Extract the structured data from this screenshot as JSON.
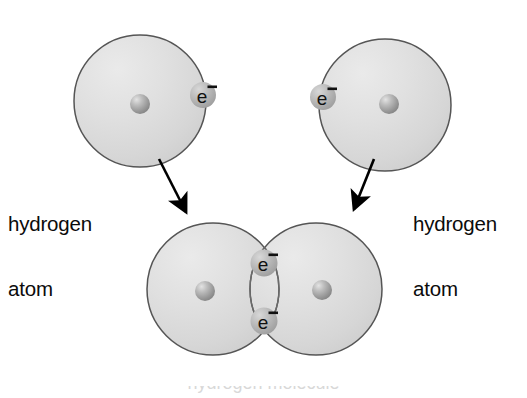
{
  "figure": {
    "background_color": "#ffffff",
    "outline_color": "#4a4a4a",
    "shell_fill_color": "#d9d9d9",
    "shell_fill_light": "#ececec",
    "nucleus_color": "#9a9a9a",
    "electron_badge_color": "#b4b4b4",
    "arrow_color": "#000000",
    "text_color": "#0b0b0b"
  },
  "labels": {
    "left_atom": {
      "line1": "hydrogen",
      "line2": "atom"
    },
    "right_atom": {
      "line1": "hydrogen",
      "line2": "atom"
    }
  },
  "bottom_caption": {
    "text": "hydrogen molecule",
    "note": "cropped at image bottom edge, only letter tips visible"
  },
  "atoms": {
    "top_left": {
      "name": "hydrogen-atom-left",
      "shell": {
        "cx": 140,
        "cy": 101,
        "r": 66
      },
      "nucleus": {
        "cx": 140,
        "cy": 104,
        "r": 10
      },
      "electron": {
        "label": "e",
        "charge": "−",
        "cx": 203,
        "cy": 95,
        "r": 13
      }
    },
    "top_right": {
      "name": "hydrogen-atom-right",
      "shell": {
        "cx": 385,
        "cy": 105,
        "r": 66
      },
      "nucleus": {
        "cx": 389,
        "cy": 104,
        "r": 10
      },
      "electron": {
        "label": "e",
        "charge": "−",
        "cx": 323,
        "cy": 97,
        "r": 13
      }
    }
  },
  "molecule": {
    "name": "hydrogen-molecule",
    "left_shell": {
      "cx": 213,
      "cy": 289,
      "r": 66
    },
    "right_shell": {
      "cx": 316,
      "cy": 289,
      "r": 66
    },
    "left_nucleus": {
      "cx": 205,
      "cy": 291,
      "r": 10
    },
    "right_nucleus": {
      "cx": 322,
      "cy": 290,
      "r": 10
    },
    "shared_electrons": [
      {
        "label": "e",
        "charge": "−",
        "cx": 264,
        "cy": 263,
        "r": 13
      },
      {
        "label": "e",
        "charge": "−",
        "cx": 264,
        "cy": 321,
        "r": 13
      }
    ]
  },
  "arrows": [
    {
      "name": "arrow-left",
      "from": {
        "x": 159,
        "y": 159
      },
      "to": {
        "x": 188,
        "y": 215
      }
    },
    {
      "name": "arrow-right",
      "from": {
        "x": 374,
        "y": 159
      },
      "to": {
        "x": 352,
        "y": 212
      }
    }
  ]
}
